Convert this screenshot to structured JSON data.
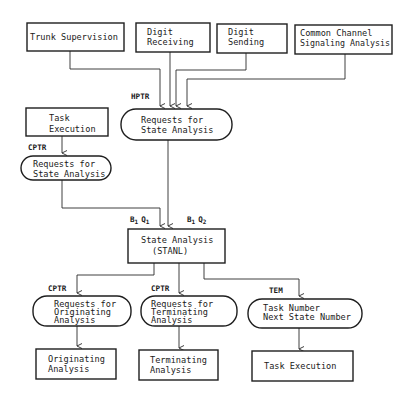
{
  "diagram": {
    "type": "flowchart",
    "colors": {
      "background": "#ffffff",
      "ink": "#1e1e1e"
    },
    "nodes": {
      "trunk_supervision": {
        "shape": "rect",
        "lines": [
          "Trunk Supervision"
        ]
      },
      "digit_receiving": {
        "shape": "rect",
        "lines": [
          "Digit",
          "Receiving"
        ]
      },
      "digit_sending": {
        "shape": "rect",
        "lines": [
          "Digit",
          "Sending"
        ]
      },
      "common_channel": {
        "shape": "rect",
        "lines": [
          "Common Channel",
          "Signaling Analysis"
        ]
      },
      "hptr_requests": {
        "shape": "pill",
        "lines": [
          "Requests for",
          "State Analysis"
        ]
      },
      "task_execution_top": {
        "shape": "rect",
        "lines": [
          "Task",
          "Execution"
        ]
      },
      "cptr_requests": {
        "shape": "pill",
        "lines": [
          "Requests for",
          "State Analysis"
        ]
      },
      "state_analysis": {
        "shape": "rect",
        "lines": [
          "State Analysis",
          "(STANL)"
        ]
      },
      "originating_requests": {
        "shape": "pill",
        "lines": [
          "Requests for",
          "Originating",
          "Analysis"
        ]
      },
      "terminating_requests": {
        "shape": "pill",
        "lines": [
          "Requests for",
          "Terminating",
          "Analysis"
        ]
      },
      "task_number": {
        "shape": "pill",
        "lines": [
          "Task Number",
          "Next State Number"
        ]
      },
      "originating_analysis": {
        "shape": "rect",
        "lines": [
          "Originating",
          "Analysis"
        ]
      },
      "terminating_analysis": {
        "shape": "rect",
        "lines": [
          "Terminating",
          "Analysis"
        ]
      },
      "task_execution_bottom": {
        "shape": "rect",
        "lines": [
          "Task Execution"
        ]
      }
    },
    "labels": {
      "hptr": "HPTR",
      "cptr_top": "CPTR",
      "b1q1": {
        "b": "B",
        "b_sub": "1",
        "q": "Q",
        "q_sub": "1"
      },
      "b1q2": {
        "b": "B",
        "b_sub": "1",
        "q": "Q",
        "q_sub": "2"
      },
      "cptr_orig": "CPTR",
      "cptr_term": "CPTR",
      "tem": "TEM"
    },
    "edges": [
      {
        "from": "trunk_supervision",
        "to": "hptr_requests"
      },
      {
        "from": "digit_receiving",
        "to": "hptr_requests"
      },
      {
        "from": "digit_sending",
        "to": "hptr_requests"
      },
      {
        "from": "common_channel",
        "to": "hptr_requests"
      },
      {
        "from": "task_execution_top",
        "to": "cptr_requests",
        "label": "CPTR"
      },
      {
        "from": "cptr_requests",
        "to": "state_analysis",
        "label": "B1 Q1"
      },
      {
        "from": "hptr_requests",
        "to": "state_analysis",
        "label": "B1 Q2"
      },
      {
        "from": "state_analysis",
        "to": "originating_requests",
        "label": "CPTR"
      },
      {
        "from": "state_analysis",
        "to": "terminating_requests",
        "label": "CPTR"
      },
      {
        "from": "state_analysis",
        "to": "task_number",
        "label": "TEM"
      },
      {
        "from": "originating_requests",
        "to": "originating_analysis"
      },
      {
        "from": "terminating_requests",
        "to": "terminating_analysis"
      },
      {
        "from": "task_number",
        "to": "task_execution_bottom"
      }
    ]
  }
}
